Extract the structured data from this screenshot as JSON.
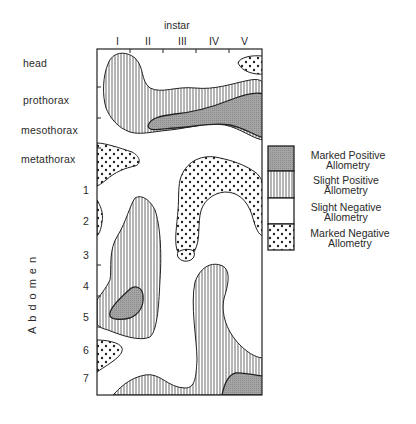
{
  "diagram": {
    "x_axis_title": "instar",
    "instars": [
      "I",
      "II",
      "III",
      "IV",
      "V"
    ],
    "segments": {
      "thorax_head": [
        "head",
        "prothorax",
        "mesothorax",
        "metathorax"
      ],
      "abdomen_label": "Abdomen",
      "abdomen": [
        "1",
        "2",
        "3",
        "4",
        "5",
        "6",
        "7"
      ]
    },
    "legend": [
      {
        "label_line1": "Marked Positive",
        "label_line2": "Allometry",
        "pattern": "grey-stipple",
        "color": "#9a9a9a"
      },
      {
        "label_line1": "Slight Positive",
        "label_line2": "Allometry",
        "pattern": "vertical-hatch",
        "color": "#333333"
      },
      {
        "label_line1": "Slight Negative",
        "label_line2": "Allometry",
        "pattern": "blank",
        "color": "#ffffff"
      },
      {
        "label_line1": "Marked Negative",
        "label_line2": "Allometry",
        "pattern": "dots",
        "color": "#222222"
      }
    ]
  }
}
